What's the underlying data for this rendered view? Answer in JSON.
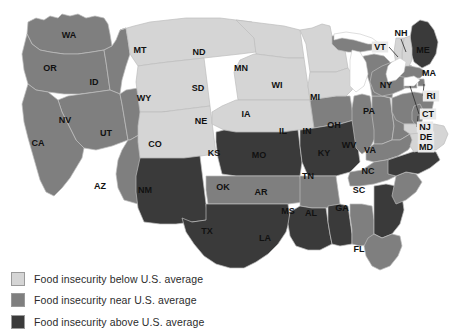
{
  "map": {
    "title_visible": false,
    "projection_note": "contiguous united states choropleth",
    "colors": {
      "below": "#d5d5d5",
      "near": "#7f7f7f",
      "above": "#3a3a3a",
      "border": "#bdbdbd",
      "lake": "#ffffff",
      "label": "#111111",
      "label_box": "#e9e9e9"
    },
    "states": [
      {
        "code": "WA",
        "category": "near",
        "label_x": 69,
        "label_y": 35
      },
      {
        "code": "OR",
        "category": "near",
        "label_x": 50,
        "label_y": 68
      },
      {
        "code": "ID",
        "category": "near",
        "label_x": 94,
        "label_y": 82
      },
      {
        "code": "NV",
        "category": "near",
        "label_x": 65,
        "label_y": 120
      },
      {
        "code": "CA",
        "category": "near",
        "label_x": 38,
        "label_y": 143
      },
      {
        "code": "UT",
        "category": "near",
        "label_x": 106,
        "label_y": 133
      },
      {
        "code": "AZ",
        "category": "near",
        "label_x": 100,
        "label_y": 186
      },
      {
        "code": "MT",
        "category": "below",
        "label_x": 140,
        "label_y": 50
      },
      {
        "code": "WY",
        "category": "below",
        "label_x": 144,
        "label_y": 98
      },
      {
        "code": "CO",
        "category": "below",
        "label_x": 155,
        "label_y": 144
      },
      {
        "code": "NM",
        "category": "above",
        "label_x": 145,
        "label_y": 190
      },
      {
        "code": "ND",
        "category": "below",
        "label_x": 199,
        "label_y": 52
      },
      {
        "code": "SD",
        "category": "below",
        "label_x": 198,
        "label_y": 88
      },
      {
        "code": "NE",
        "category": "below",
        "label_x": 201,
        "label_y": 121
      },
      {
        "code": "KS",
        "category": "above",
        "label_x": 214,
        "label_y": 153
      },
      {
        "code": "OK",
        "category": "near",
        "label_x": 223,
        "label_y": 187
      },
      {
        "code": "TX",
        "category": "above",
        "label_x": 207,
        "label_y": 231
      },
      {
        "code": "MN",
        "category": "below",
        "label_x": 241,
        "label_y": 68
      },
      {
        "code": "IA",
        "category": "near",
        "label_x": 246,
        "label_y": 114
      },
      {
        "code": "MO",
        "category": "above",
        "label_x": 259,
        "label_y": 155
      },
      {
        "code": "AR",
        "category": "near",
        "label_x": 261,
        "label_y": 192
      },
      {
        "code": "LA",
        "category": "above",
        "label_x": 265,
        "label_y": 238
      },
      {
        "code": "WI",
        "category": "below",
        "label_x": 277,
        "label_y": 85
      },
      {
        "code": "IL",
        "category": "near",
        "label_x": 283,
        "label_y": 131
      },
      {
        "code": "MS",
        "category": "above",
        "label_x": 288,
        "label_y": 211
      },
      {
        "code": "IN",
        "category": "near",
        "label_x": 307,
        "label_y": 131
      },
      {
        "code": "MI",
        "category": "near",
        "label_x": 315,
        "label_y": 97
      },
      {
        "code": "AL",
        "category": "near",
        "label_x": 311,
        "label_y": 213
      },
      {
        "code": "OH",
        "category": "near",
        "label_x": 334,
        "label_y": 125
      },
      {
        "code": "KY",
        "category": "near",
        "label_x": 324,
        "label_y": 153
      },
      {
        "code": "TN",
        "category": "near",
        "label_x": 308,
        "label_y": 176
      },
      {
        "code": "GA",
        "category": "above",
        "label_x": 342,
        "label_y": 208
      },
      {
        "code": "FL",
        "category": "near",
        "label_x": 359,
        "label_y": 249
      },
      {
        "code": "SC",
        "category": "near",
        "label_x": 359,
        "label_y": 190
      },
      {
        "code": "NC",
        "category": "above",
        "label_x": 368,
        "label_y": 171
      },
      {
        "code": "WV",
        "category": "below",
        "label_x": 349,
        "label_y": 145
      },
      {
        "code": "VA",
        "category": "below",
        "label_x": 370,
        "label_y": 150
      },
      {
        "code": "PA",
        "category": "near",
        "label_x": 369,
        "label_y": 111
      },
      {
        "code": "NY",
        "category": "near",
        "label_x": 386,
        "label_y": 85
      },
      {
        "code": "ME",
        "category": "above",
        "label_x": 423,
        "label_y": 50
      },
      {
        "code": "MA",
        "category": "near",
        "label_x": 429,
        "label_y": 73
      },
      {
        "code": "NH",
        "category": "below",
        "label_x": 401,
        "label_y": 33
      },
      {
        "code": "VT",
        "category": "below",
        "label_x": 380,
        "label_y": 47
      },
      {
        "code": "RI",
        "category": "near",
        "label_x": 431,
        "label_y": 96
      },
      {
        "code": "CT",
        "category": "near",
        "label_x": 428,
        "label_y": 114
      },
      {
        "code": "NJ",
        "category": "near",
        "label_x": 425,
        "label_y": 127
      },
      {
        "code": "DE",
        "category": "below",
        "label_x": 426,
        "label_y": 137
      },
      {
        "code": "MD",
        "category": "below",
        "label_x": 426,
        "label_y": 147
      }
    ],
    "boxed_labels": [
      "VT",
      "RI",
      "CT",
      "NJ",
      "DE",
      "MD"
    ]
  },
  "legend": {
    "items": [
      {
        "swatch": "below",
        "label": "Food insecurity below U.S. average",
        "color": "#d5d5d5"
      },
      {
        "swatch": "near",
        "label": "Food insecurity near U.S. average",
        "color": "#7f7f7f"
      },
      {
        "swatch": "above",
        "label": "Food insecurity above U.S. average",
        "color": "#3a3a3a"
      }
    ]
  }
}
